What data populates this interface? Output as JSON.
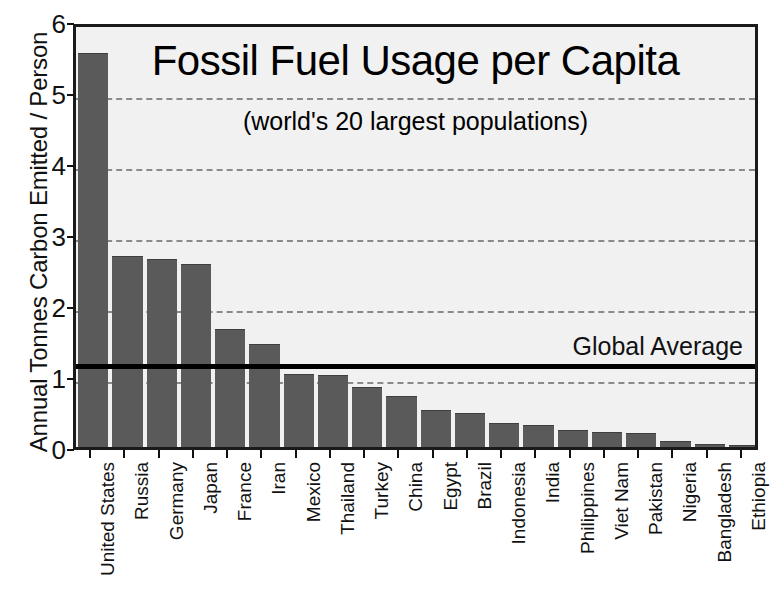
{
  "chart_data": {
    "type": "bar",
    "title": "Fossil Fuel Usage per Capita",
    "subtitle": "(world's 20 largest populations)",
    "xlabel": "",
    "ylabel": "Annual Tonnes Carbon Emitted / Person",
    "ylim": [
      0,
      6
    ],
    "yticks": [
      0,
      1,
      2,
      3,
      4,
      5,
      6
    ],
    "ytick_labels": [
      "0",
      "1",
      "2",
      "3",
      "4",
      "5",
      "6"
    ],
    "grid": "horizontal-dashed",
    "legend": "none",
    "bar_color": "#5a5a5a",
    "plot_background": "#f1f1f1",
    "categories": [
      "United States",
      "Russia",
      "Germany",
      "Japan",
      "France",
      "Iran",
      "Mexico",
      "Thailand",
      "Turkey",
      "China",
      "Egypt",
      "Brazil",
      "Indonesia",
      "India",
      "Philippines",
      "Viet Nam",
      "Pakistan",
      "Nigeria",
      "Bangladesh",
      "Ethiopia"
    ],
    "values": [
      5.53,
      2.68,
      2.64,
      2.56,
      1.65,
      1.44,
      1.02,
      1.0,
      0.83,
      0.71,
      0.51,
      0.46,
      0.33,
      0.3,
      0.23,
      0.2,
      0.18,
      0.07,
      0.03,
      0.01
    ],
    "annotations": [
      {
        "name": "global-average",
        "label": "Global Average",
        "value": 1.22,
        "style": "solid-black-line",
        "color": "#000000"
      }
    ]
  },
  "axis": {
    "y_title": "Annual Tonnes Carbon Emitted / Person"
  },
  "annotation_label": "Global Average"
}
